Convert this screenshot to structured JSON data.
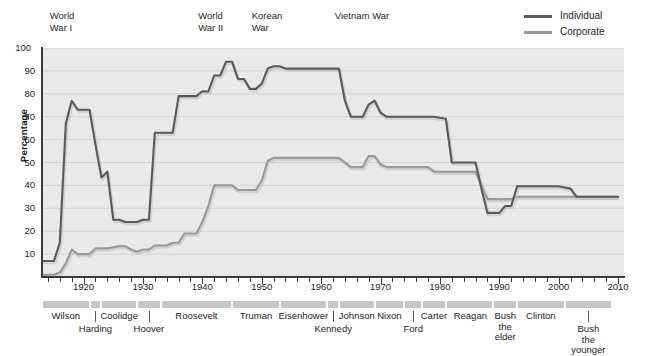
{
  "chart_data": {
    "type": "line",
    "title": "",
    "xlabel": "",
    "ylabel": "Percentage",
    "xlim": [
      1913,
      2011
    ],
    "ylim": [
      0,
      100
    ],
    "grid": true,
    "legend_position": "top-right",
    "x_ticks": [
      "1920",
      "1930",
      "1940",
      "1950",
      "1960",
      "1970",
      "1980",
      "1990",
      "2000",
      "2010"
    ],
    "y_ticks": [
      "10",
      "20",
      "30",
      "40",
      "50",
      "60",
      "70",
      "80",
      "90",
      "100"
    ],
    "minor_tick_interval_years": 2,
    "colors": {
      "individual": "#5a5a5a",
      "corporate": "#9a9a9a",
      "plot_background": "#e9e9e9",
      "gridline": "#d2d2d2",
      "president_bar": "#c6c6c6"
    },
    "series": [
      {
        "name": "Individual",
        "color": "#5a5a5a",
        "points": [
          [
            1913,
            7
          ],
          [
            1915,
            7
          ],
          [
            1916,
            15
          ],
          [
            1917,
            67
          ],
          [
            1918,
            77
          ],
          [
            1919,
            73
          ],
          [
            1920,
            73
          ],
          [
            1921,
            73
          ],
          [
            1922,
            58
          ],
          [
            1923,
            43.5
          ],
          [
            1924,
            46
          ],
          [
            1925,
            25
          ],
          [
            1926,
            25
          ],
          [
            1927,
            24
          ],
          [
            1928,
            24
          ],
          [
            1929,
            24
          ],
          [
            1930,
            25
          ],
          [
            1931,
            25
          ],
          [
            1932,
            63
          ],
          [
            1933,
            63
          ],
          [
            1934,
            63
          ],
          [
            1935,
            63
          ],
          [
            1936,
            79
          ],
          [
            1937,
            79
          ],
          [
            1938,
            79
          ],
          [
            1939,
            79
          ],
          [
            1940,
            81.1
          ],
          [
            1941,
            81
          ],
          [
            1942,
            88
          ],
          [
            1943,
            88
          ],
          [
            1944,
            94
          ],
          [
            1945,
            94
          ],
          [
            1946,
            86.45
          ],
          [
            1947,
            86.45
          ],
          [
            1948,
            82.13
          ],
          [
            1949,
            82.13
          ],
          [
            1950,
            84.36
          ],
          [
            1951,
            91
          ],
          [
            1952,
            92
          ],
          [
            1953,
            92
          ],
          [
            1954,
            91
          ],
          [
            1955,
            91
          ],
          [
            1960,
            91
          ],
          [
            1963,
            91
          ],
          [
            1964,
            77
          ],
          [
            1965,
            70
          ],
          [
            1966,
            70
          ],
          [
            1967,
            70
          ],
          [
            1968,
            75.25
          ],
          [
            1969,
            77
          ],
          [
            1970,
            71.75
          ],
          [
            1971,
            70
          ],
          [
            1972,
            70
          ],
          [
            1979,
            70
          ],
          [
            1981,
            69.125
          ],
          [
            1982,
            50
          ],
          [
            1983,
            50
          ],
          [
            1986,
            50
          ],
          [
            1987,
            38.5
          ],
          [
            1988,
            28
          ],
          [
            1990,
            28
          ],
          [
            1991,
            31
          ],
          [
            1992,
            31
          ],
          [
            1993,
            39.6
          ],
          [
            1994,
            39.6
          ],
          [
            2000,
            39.6
          ],
          [
            2001,
            39.1
          ],
          [
            2002,
            38.6
          ],
          [
            2003,
            35
          ],
          [
            2004,
            35
          ],
          [
            2010,
            35
          ]
        ]
      },
      {
        "name": "Corporate",
        "color": "#9a9a9a",
        "points": [
          [
            1913,
            1
          ],
          [
            1915,
            1
          ],
          [
            1916,
            2
          ],
          [
            1917,
            6
          ],
          [
            1918,
            12
          ],
          [
            1919,
            10
          ],
          [
            1920,
            10
          ],
          [
            1921,
            10
          ],
          [
            1922,
            12.5
          ],
          [
            1923,
            12.5
          ],
          [
            1924,
            12.5
          ],
          [
            1925,
            13
          ],
          [
            1926,
            13.5
          ],
          [
            1927,
            13.5
          ],
          [
            1928,
            12
          ],
          [
            1929,
            11
          ],
          [
            1930,
            12
          ],
          [
            1931,
            12
          ],
          [
            1932,
            13.75
          ],
          [
            1933,
            13.75
          ],
          [
            1934,
            13.75
          ],
          [
            1935,
            15
          ],
          [
            1936,
            15
          ],
          [
            1937,
            19
          ],
          [
            1938,
            19
          ],
          [
            1939,
            19
          ],
          [
            1940,
            24
          ],
          [
            1941,
            31
          ],
          [
            1942,
            40
          ],
          [
            1943,
            40
          ],
          [
            1944,
            40
          ],
          [
            1945,
            40
          ],
          [
            1946,
            38
          ],
          [
            1947,
            38
          ],
          [
            1948,
            38
          ],
          [
            1949,
            38
          ],
          [
            1950,
            42
          ],
          [
            1951,
            50.75
          ],
          [
            1952,
            52
          ],
          [
            1953,
            52
          ],
          [
            1954,
            52
          ],
          [
            1960,
            52
          ],
          [
            1963,
            52
          ],
          [
            1964,
            50
          ],
          [
            1965,
            48
          ],
          [
            1966,
            48
          ],
          [
            1967,
            48
          ],
          [
            1968,
            52.8
          ],
          [
            1969,
            52.8
          ],
          [
            1970,
            49.2
          ],
          [
            1971,
            48
          ],
          [
            1972,
            48
          ],
          [
            1978,
            48
          ],
          [
            1979,
            46
          ],
          [
            1980,
            46
          ],
          [
            1986,
            46
          ],
          [
            1987,
            40
          ],
          [
            1988,
            34
          ],
          [
            1990,
            34
          ],
          [
            1991,
            34
          ],
          [
            1992,
            34
          ],
          [
            1993,
            35
          ],
          [
            1994,
            35
          ],
          [
            2000,
            35
          ],
          [
            2003,
            35
          ],
          [
            2010,
            35
          ]
        ]
      }
    ],
    "annotations": [
      {
        "label": "World\nWar I",
        "x_year": 1917
      },
      {
        "label": "World\nWar II",
        "x_year": 1942
      },
      {
        "label": "Korean\nWar",
        "x_year": 1951
      },
      {
        "label": "Vietnam War",
        "x_year": 1965
      }
    ],
    "presidents": [
      {
        "name": "Wilson",
        "start": 1913,
        "end": 1921,
        "row": 0
      },
      {
        "name": "Harding",
        "start": 1921,
        "end": 1923,
        "row": 1
      },
      {
        "name": "Coolidge",
        "start": 1923,
        "end": 1929,
        "row": 0
      },
      {
        "name": "Hoover",
        "start": 1929,
        "end": 1933,
        "row": 1
      },
      {
        "name": "Roosevelt",
        "start": 1933,
        "end": 1945,
        "row": 0
      },
      {
        "name": "Truman",
        "start": 1945,
        "end": 1953,
        "row": 0
      },
      {
        "name": "Eisenhower",
        "start": 1953,
        "end": 1961,
        "row": 0
      },
      {
        "name": "Kennedy",
        "start": 1961,
        "end": 1963,
        "row": 1
      },
      {
        "name": "Johnson",
        "start": 1963,
        "end": 1969,
        "row": 0
      },
      {
        "name": "Nixon",
        "start": 1969,
        "end": 1974,
        "row": 0
      },
      {
        "name": "Ford",
        "start": 1974,
        "end": 1977,
        "row": 1
      },
      {
        "name": "Carter",
        "start": 1977,
        "end": 1981,
        "row": 0
      },
      {
        "name": "Reagan",
        "start": 1981,
        "end": 1989,
        "row": 0
      },
      {
        "name": "Bush\nthe\nelder",
        "start": 1989,
        "end": 1993,
        "row": 0
      },
      {
        "name": "Clinton",
        "start": 1993,
        "end": 2001,
        "row": 0
      },
      {
        "name": "Bush\nthe\nyounger",
        "start": 2001,
        "end": 2009,
        "row": 1
      }
    ]
  },
  "legend": {
    "items": [
      {
        "label": "Individual",
        "color": "#5a5a5a"
      },
      {
        "label": "Corporate",
        "color": "#9a9a9a"
      }
    ]
  },
  "axes": {
    "y_title": "Percentage"
  }
}
